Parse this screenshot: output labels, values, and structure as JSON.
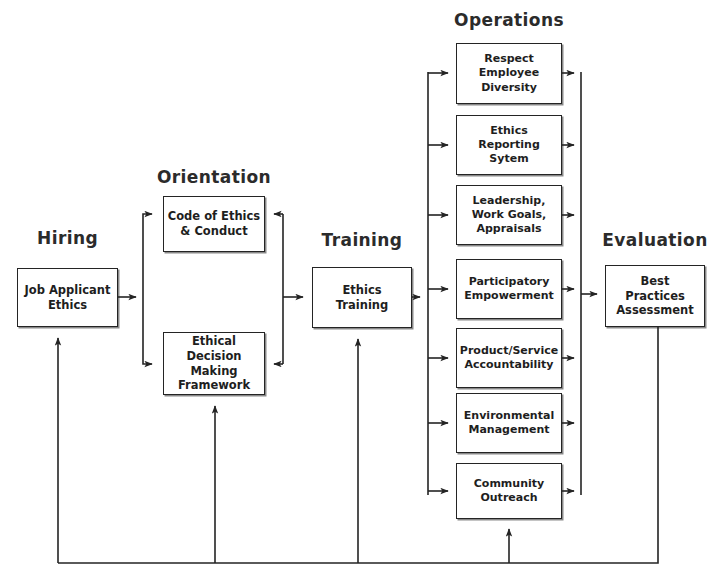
{
  "diagram": {
    "type": "flow-diagram",
    "stroke_color": "#242424",
    "text_color": "#1e1e1e",
    "background": "#ffffff",
    "stages": [
      {
        "id": "hiring",
        "heading": "Hiring",
        "nodes": [
          {
            "id": "job-applicant-ethics",
            "label": "Job Applicant\nEthics",
            "line1": "Job Applicant",
            "line2": "Ethics"
          }
        ]
      },
      {
        "id": "orientation",
        "heading": "Orientation",
        "nodes": [
          {
            "id": "code-of-ethics",
            "label": "Code of Ethics\n& Conduct",
            "line1": "Code of Ethics",
            "line2": "& Conduct"
          },
          {
            "id": "ethical-decision-framework",
            "label": "Ethical Decision\nMaking\nFramework",
            "line1": "Ethical Decision",
            "line2": "Making",
            "line3": "Framework"
          }
        ]
      },
      {
        "id": "training",
        "heading": "Training",
        "nodes": [
          {
            "id": "ethics-training",
            "label": "Ethics\nTraining",
            "line1": "Ethics",
            "line2": "Training"
          }
        ]
      },
      {
        "id": "operations",
        "heading": "Operations",
        "nodes": [
          {
            "id": "respect-employee-diversity",
            "label": "Respect Employee Diversity",
            "line1": "Respect",
            "line2": "Employee",
            "line3": "Diversity"
          },
          {
            "id": "ethics-reporting-sytem",
            "label": "Ethics Reporting Sytem",
            "line1": "Ethics",
            "line2": "Reporting",
            "line3": "Sytem"
          },
          {
            "id": "leadership-work-goals-appraisals",
            "label": "Leadership, Work Goals, Appraisals",
            "line1": "Leadership,",
            "line2": "Work Goals,",
            "line3": "Appraisals"
          },
          {
            "id": "participatory-empowerment",
            "label": "Participatory Empowerment",
            "line1": "Participatory",
            "line2": "Empowerment",
            "line3": ""
          },
          {
            "id": "product-service-accountability",
            "label": "Product/Service Accountability",
            "line1": "Product/Service",
            "line2": "Accountability",
            "line3": ""
          },
          {
            "id": "environmental-management",
            "label": "Environmental Management",
            "line1": "Environmental",
            "line2": "Management",
            "line3": ""
          },
          {
            "id": "community-outreach",
            "label": "Community Outreach",
            "line1": "Community",
            "line2": "Outreach",
            "line3": ""
          }
        ]
      },
      {
        "id": "evaluation",
        "heading": "Evaluation",
        "nodes": [
          {
            "id": "best-practices-assessment",
            "label": "Best Practices\nAssessment",
            "line1": "Best Practices",
            "line2": "Assessment"
          }
        ]
      }
    ],
    "feedback": {
      "description": "Bottom feedback bus from Best Practices Assessment back to Hiring, Orientation, Training and Operations",
      "targets": [
        "job-applicant-ethics",
        "ethical-decision-framework",
        "ethics-training",
        "community-outreach"
      ]
    }
  }
}
